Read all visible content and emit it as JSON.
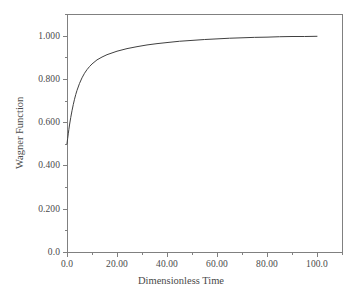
{
  "chart_data": {
    "type": "line",
    "title": "",
    "subtitle": "",
    "xlabel": "Dimensionless Time",
    "ylabel": "Wagner Function",
    "xlim": [
      0,
      110
    ],
    "ylim": [
      0,
      1.1
    ],
    "grid": false,
    "legend": null,
    "legend_position": "none",
    "annotations": [],
    "x_ticks": [
      {
        "value": 0,
        "label": "0.0"
      },
      {
        "value": 20,
        "label": "20.00"
      },
      {
        "value": 40,
        "label": "40.00"
      },
      {
        "value": 60,
        "label": "60.00"
      },
      {
        "value": 80,
        "label": "80.00"
      },
      {
        "value": 100,
        "label": "100.0"
      }
    ],
    "x_minor_ticks": [
      10,
      30,
      50,
      70,
      90,
      110
    ],
    "y_ticks": [
      {
        "value": 0.0,
        "label": "0.0"
      },
      {
        "value": 0.2,
        "label": "0.200"
      },
      {
        "value": 0.4,
        "label": "0.400"
      },
      {
        "value": 0.6,
        "label": "0.600"
      },
      {
        "value": 0.8,
        "label": "0.800"
      },
      {
        "value": 1.0,
        "label": "1.000"
      }
    ],
    "y_minor_ticks": [
      0.1,
      0.3,
      0.5,
      0.7,
      0.9,
      1.1
    ],
    "series": [
      {
        "name": "Wagner Function",
        "color": "#404040",
        "line_width": 1,
        "x": [
          0,
          0.25,
          0.5,
          0.75,
          1,
          1.5,
          2,
          2.5,
          3,
          3.5,
          4,
          5,
          6,
          7,
          8,
          9,
          10,
          12,
          14,
          16,
          18,
          20,
          24,
          28,
          32,
          36,
          40,
          45,
          50,
          55,
          60,
          65,
          70,
          75,
          80,
          85,
          90,
          95,
          100
        ],
        "y": [
          0.5,
          0.524,
          0.546,
          0.567,
          0.587,
          0.622,
          0.653,
          0.681,
          0.706,
          0.728,
          0.747,
          0.779,
          0.805,
          0.826,
          0.843,
          0.857,
          0.869,
          0.888,
          0.901,
          0.912,
          0.92,
          0.928,
          0.94,
          0.949,
          0.957,
          0.963,
          0.968,
          0.974,
          0.978,
          0.982,
          0.985,
          0.988,
          0.99,
          0.992,
          0.993,
          0.995,
          0.996,
          0.996,
          0.997
        ]
      }
    ],
    "axis_color": "#808080",
    "text_color": "#4a4a4a"
  },
  "layout": {
    "plot_left": 67,
    "plot_right": 342,
    "plot_top": 14,
    "plot_bottom": 252
  }
}
